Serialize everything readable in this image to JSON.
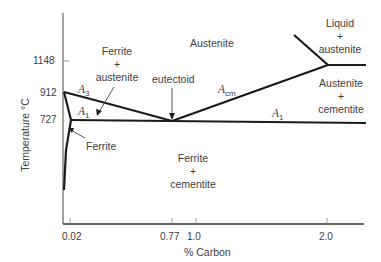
{
  "diagram": {
    "type": "phase-diagram",
    "title": "",
    "axes": {
      "y_label": "Temperature °C",
      "x_label": "% Carbon",
      "y_ticks": [
        {
          "label": "1148",
          "value": 1148
        },
        {
          "label": "912",
          "value": 912
        },
        {
          "label": "727",
          "value": 727
        }
      ],
      "x_ticks": [
        {
          "label": "0.02",
          "value": 0.02
        },
        {
          "label": "0.77",
          "value": 0.77
        },
        {
          "label": "1.0",
          "value": 1.0
        },
        {
          "label": "2.0",
          "value": 2.0
        }
      ]
    },
    "regions": {
      "austenite": "Austenite",
      "ferrite_austenite": [
        "Ferrite",
        "+",
        "austenite"
      ],
      "liquid_austenite": [
        "Liquid",
        "+",
        "austenite"
      ],
      "austenite_cementite": [
        "Austenite",
        "+",
        "cementite"
      ],
      "ferrite_cementite": [
        "Ferrite",
        "+",
        "cementite"
      ],
      "ferrite": "Ferrite"
    },
    "annotations": {
      "eutectoid": "eutectoid",
      "a3": {
        "main": "A",
        "sub": "3"
      },
      "a1_left": {
        "main": "A",
        "sub": "1"
      },
      "a1_right": {
        "main": "A",
        "sub": "1"
      },
      "acm": {
        "main": "A",
        "sub": "cm"
      }
    },
    "lines": [
      {
        "name": "A3",
        "from": [
          0.0,
          912
        ],
        "to": [
          0.77,
          727
        ]
      },
      {
        "name": "A1",
        "from": [
          0.02,
          727
        ],
        "to": [
          2.3,
          727
        ]
      },
      {
        "name": "Acm",
        "from": [
          0.77,
          727
        ],
        "to": [
          2.0,
          1148
        ]
      },
      {
        "name": "liquidus",
        "from": [
          1.6,
          1320
        ],
        "to": [
          2.0,
          1148
        ]
      },
      {
        "name": "solidus-1148",
        "from": [
          2.0,
          1148
        ],
        "to": [
          2.3,
          1148
        ]
      },
      {
        "name": "ferrite-solvus",
        "from": [
          0.02,
          727
        ],
        "to": [
          0.0,
          400
        ]
      }
    ],
    "colors": {
      "line": "#1a1a1a",
      "axis": "#555555",
      "text": "#404040"
    }
  }
}
